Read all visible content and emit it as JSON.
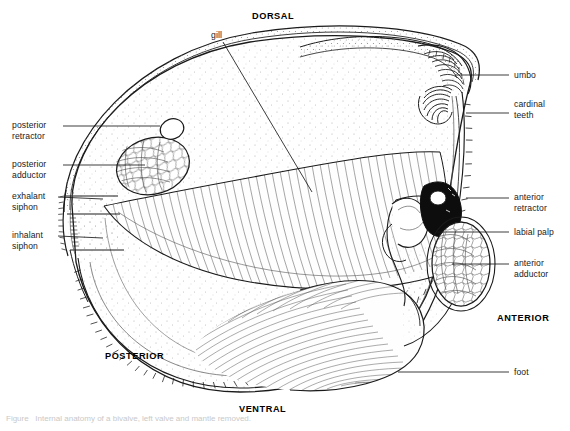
{
  "figure": {
    "background_color": "#ffffff",
    "ink_color": "#1a1a1a",
    "shell_fill": "#fdfdfd",
    "stipple_color": "#7a7a7a",
    "caption_text": "Figure   Internal anatomy of a bivalve, left valve and mantle removed."
  },
  "orientation_labels": [
    {
      "id": "dorsal",
      "text": "DORSAL",
      "x": 252,
      "y": 11
    },
    {
      "id": "ventral",
      "text": "VENTRAL",
      "x": 239,
      "y": 404
    },
    {
      "id": "anterior",
      "text": "ANTERIOR",
      "x": 497,
      "y": 313
    },
    {
      "id": "posterior",
      "text": "POSTERIOR",
      "x": 105,
      "y": 351
    }
  ],
  "left_labels": [
    {
      "id": "posterior-retractor",
      "lines": [
        "posterior",
        "retractor"
      ],
      "x": 12,
      "y": 120,
      "leader": {
        "x1": 63,
        "y1": 126,
        "x2": 160,
        "y2": 126
      }
    },
    {
      "id": "posterior-adductor",
      "lines": [
        "posterior",
        "adductor"
      ],
      "x": 12,
      "y": 159,
      "leader": {
        "x1": 63,
        "y1": 165,
        "x2": 145,
        "y2": 165
      }
    },
    {
      "id": "exhalant-siphon",
      "lines": [
        "exhalant",
        "siphon"
      ],
      "x": 12,
      "y": 191,
      "leader": {
        "x1": 58,
        "y1": 197,
        "x2": 103,
        "y2": 199
      }
    },
    {
      "id": "inhalant-siphon",
      "lines": [
        "inhalant",
        "siphon"
      ],
      "x": 12,
      "y": 230,
      "leader": {
        "x1": 58,
        "y1": 236,
        "x2": 103,
        "y2": 238
      }
    }
  ],
  "right_labels": [
    {
      "id": "umbo",
      "lines": [
        "umbo"
      ],
      "x": 514,
      "y": 70,
      "leader": {
        "x1": 455,
        "y1": 75,
        "x2": 509,
        "y2": 75
      }
    },
    {
      "id": "cardinal-teeth",
      "lines": [
        "cardinal",
        "teeth"
      ],
      "x": 514,
      "y": 99,
      "leader": {
        "x1": 466,
        "y1": 113,
        "x2": 509,
        "y2": 113
      }
    },
    {
      "id": "anterior-retractor",
      "lines": [
        "anterior",
        "retractor"
      ],
      "x": 514,
      "y": 192,
      "leader": {
        "x1": 466,
        "y1": 198,
        "x2": 509,
        "y2": 198
      }
    },
    {
      "id": "labial-palp",
      "lines": [
        "labial palp"
      ],
      "x": 514,
      "y": 227,
      "leader": {
        "x1": 437,
        "y1": 232,
        "x2": 509,
        "y2": 232
      }
    },
    {
      "id": "anterior-adductor",
      "lines": [
        "anterior",
        "adductor"
      ],
      "x": 514,
      "y": 258,
      "leader": {
        "x1": 452,
        "y1": 264,
        "x2": 509,
        "y2": 264
      }
    },
    {
      "id": "foot",
      "lines": [
        "foot"
      ],
      "x": 514,
      "y": 367,
      "leader": {
        "x1": 398,
        "y1": 372,
        "x2": 509,
        "y2": 372
      }
    }
  ],
  "top_labels": [
    {
      "id": "gill",
      "lines": [
        "gill"
      ],
      "x": 211,
      "y": 30,
      "leader": {
        "x1": 223,
        "y1": 42,
        "x2": 312,
        "y2": 192
      }
    }
  ],
  "structures": [
    {
      "id": "shell-valve",
      "name": "right shell valve",
      "note": "large ovate outline spanning the figure"
    },
    {
      "id": "mantle",
      "name": "mantle",
      "note": "fringed margin along ventral/posterior edge"
    },
    {
      "id": "gill",
      "name": "gill (ctenidium)",
      "note": "lens-shaped, finely striated"
    },
    {
      "id": "foot",
      "name": "foot",
      "note": "large hatched muscular mass, ventral-anterior"
    },
    {
      "id": "posterior-adductor",
      "name": "posterior adductor",
      "note": "ellipse with cellular texture"
    },
    {
      "id": "posterior-retractor",
      "name": "posterior retractor",
      "note": "small oval above adductor"
    },
    {
      "id": "anterior-adductor",
      "name": "anterior adductor",
      "note": "teardrop with cellular texture"
    },
    {
      "id": "anterior-retractor",
      "name": "anterior retractor",
      "note": "dark wedge near hinge"
    },
    {
      "id": "labial-palp",
      "name": "labial palp",
      "note": "curved flap anterior to gill"
    },
    {
      "id": "umbo",
      "name": "umbo",
      "note": "beak at dorsal-anterior hinge"
    },
    {
      "id": "cardinal-teeth",
      "name": "cardinal teeth",
      "note": "radiating hinge ridges"
    },
    {
      "id": "exhalant-siphon",
      "name": "exhalant siphon",
      "note": "upper posterior opening"
    },
    {
      "id": "inhalant-siphon",
      "name": "inhalant siphon",
      "note": "lower posterior fringed opening"
    }
  ]
}
